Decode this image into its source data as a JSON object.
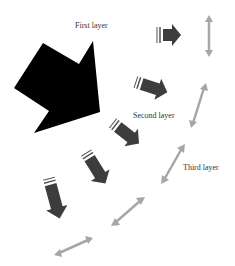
{
  "labels": {
    "first": "First layer",
    "second": "Second layer",
    "third": "Third layer"
  },
  "colors": {
    "background": "#ffffff",
    "main_arrow": "#000000",
    "layer_arrows": "#3d3d3d",
    "double_arrows": "#a6a6a6",
    "text": "#333333"
  },
  "diagram": {
    "main_arrow": {
      "direction": "down-right",
      "fill": "solid black"
    },
    "dark_arrows": [
      {
        "id": 1,
        "direction": "right",
        "with_motion_lines": true
      },
      {
        "id": 2,
        "direction": "down-right",
        "with_motion_lines": true
      },
      {
        "id": 3,
        "direction": "down-right",
        "with_motion_lines": true
      },
      {
        "id": 4,
        "direction": "down",
        "with_motion_lines": true
      },
      {
        "id": 5,
        "direction": "down",
        "with_motion_lines": true
      }
    ],
    "double_headed_arrows": 5
  }
}
